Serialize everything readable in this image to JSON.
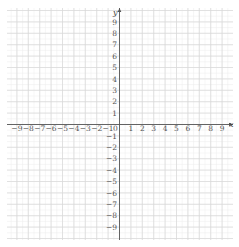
{
  "diagram": {
    "type": "coordinate-plane",
    "x_axis": {
      "label": "x",
      "min": -9,
      "max": 9,
      "step": 1
    },
    "y_axis": {
      "label": "y",
      "min": -9,
      "max": 9,
      "step": 1
    },
    "origin_label": "0",
    "x_tick_labels": [
      "−9",
      "−8",
      "−7",
      "−6",
      "−5",
      "−4",
      "−3",
      "−2",
      "−1",
      "1",
      "2",
      "3",
      "4",
      "5",
      "6",
      "7",
      "8",
      "9"
    ],
    "y_tick_labels": [
      "9",
      "8",
      "7",
      "6",
      "5",
      "4",
      "3",
      "2",
      "1",
      "−1",
      "−2",
      "−3",
      "−4",
      "−5",
      "−6",
      "−7",
      "−8",
      "−9"
    ],
    "grid": {
      "minor_per_unit": 2,
      "show": true
    }
  },
  "colors": {
    "background": "#ffffff",
    "grid_major": "#d9d9d9",
    "grid_minor": "#ececec",
    "axis": "#555555",
    "tick_text": "#555555"
  }
}
